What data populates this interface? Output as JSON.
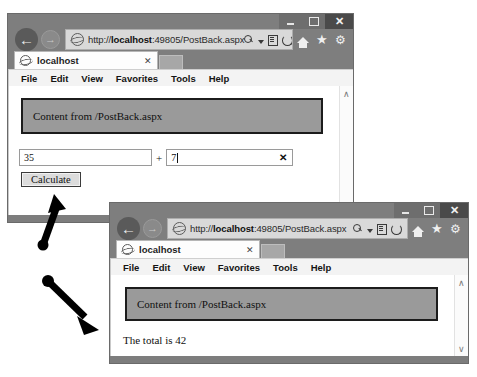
{
  "windows": {
    "back_window": {
      "name": "PostBack form window",
      "titlebar": {
        "minimize_label": "",
        "maximize_label": "",
        "close_label": "✕"
      },
      "nav": {
        "back_label": "←",
        "forward_label": "→",
        "url_prefix": "http://",
        "url_host": "localhost",
        "url_rest": ":49805/PostBack.aspx",
        "search_icon": "search-icon",
        "caret_icon": "chevron-down-icon",
        "page_icon": "page-icon",
        "refresh_icon": "refresh-icon",
        "home_icon": "home-icon",
        "favorites_icon": "star-icon",
        "tools_icon": "gear-icon"
      },
      "tab": {
        "title": "localhost",
        "close_label": "✕"
      },
      "menu": [
        "File",
        "Edit",
        "View",
        "Favorites",
        "Tools",
        "Help"
      ],
      "page": {
        "panel_text": "Content from /PostBack.aspx",
        "operand_a": "35",
        "operator": "+",
        "operand_b": "7",
        "clear_label": "✕",
        "button_label": "Calculate",
        "scroll_up": "∧",
        "scroll_down": "∨"
      }
    },
    "front_window": {
      "name": "PostBack result window",
      "titlebar": {
        "minimize_label": "",
        "maximize_label": "",
        "close_label": "✕"
      },
      "nav": {
        "back_label": "←",
        "forward_label": "→",
        "url_prefix": "http://",
        "url_host": "localhost",
        "url_rest": ":49805/PostBack.aspx",
        "search_icon": "search-icon",
        "caret_icon": "chevron-down-icon",
        "page_icon": "page-icon",
        "refresh_icon": "refresh-icon",
        "home_icon": "home-icon",
        "favorites_icon": "star-icon",
        "tools_icon": "gear-icon"
      },
      "tab": {
        "title": "localhost",
        "close_label": "✕"
      },
      "menu": [
        "File",
        "Edit",
        "View",
        "Favorites",
        "Tools",
        "Help"
      ],
      "page": {
        "panel_text": "Content from /PostBack.aspx",
        "result_text": "The total is 42",
        "scroll_up": "∧",
        "scroll_down": "∨"
      }
    }
  },
  "annotations": {
    "arrow_to_calculate": "arrow pointing up-left at the Calculate button",
    "arrow_to_result": "arrow pointing down-right at the result window"
  },
  "colors": {
    "chrome": "#7e7e7e",
    "panel_fill": "#9a9a9a",
    "panel_border": "#1c1c1c",
    "page_bg": "#ffffff",
    "annotation": "#000000"
  }
}
